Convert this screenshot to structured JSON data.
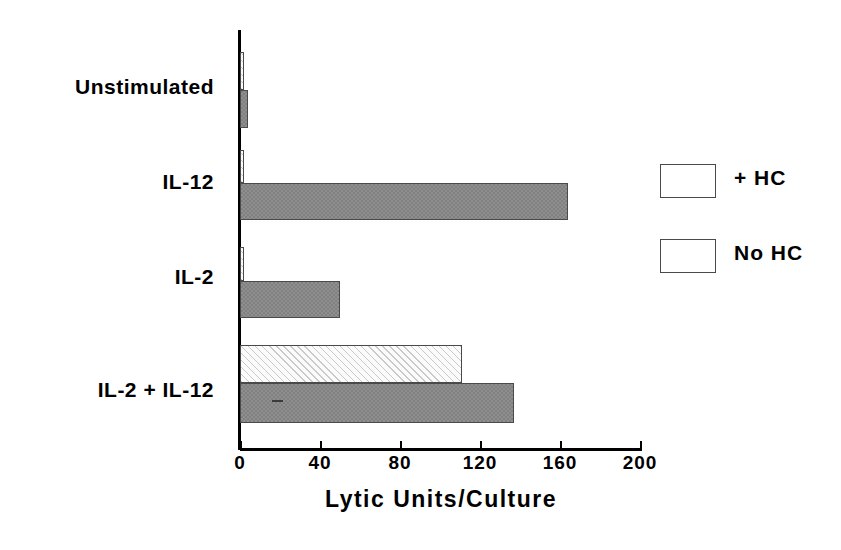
{
  "chart_data": {
    "type": "bar",
    "orientation": "horizontal",
    "title": "",
    "xlabel": "Lytic Units/Culture",
    "ylabel": "",
    "xlim": [
      0,
      200
    ],
    "xticks": [
      0,
      40,
      80,
      120,
      160,
      200
    ],
    "xtick_labels": [
      "0",
      "40",
      "80",
      "120",
      "160",
      "200"
    ],
    "grid": false,
    "legend_position": "right",
    "categories": [
      "Unstimulated",
      "IL-12",
      "IL-2",
      "IL-2 + IL-12"
    ],
    "series": [
      {
        "name": "+ HC",
        "values": [
          2,
          2,
          2,
          111
        ]
      },
      {
        "name": "No HC",
        "values": [
          4,
          164,
          50,
          137
        ]
      }
    ],
    "colors": {
      "plus_hc": "#fbfbfb",
      "no_hc": "#808080",
      "outline": "#4a4a4a",
      "axis": "#000000"
    }
  },
  "legend": {
    "items": [
      {
        "label": "+ HC",
        "style": "hatched"
      },
      {
        "label": "No HC",
        "style": "solid-gray"
      }
    ]
  },
  "axis": {
    "x_title": "Lytic Units/Culture"
  }
}
